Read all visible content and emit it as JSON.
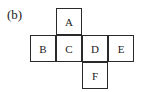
{
  "figure_label": "(b)",
  "net": {
    "description": "Cube net",
    "cells": [
      {
        "label": "A",
        "col": 1,
        "row": 0
      },
      {
        "label": "B",
        "col": 0,
        "row": 1
      },
      {
        "label": "C",
        "col": 1,
        "row": 1
      },
      {
        "label": "D",
        "col": 2,
        "row": 1
      },
      {
        "label": "E",
        "col": 3,
        "row": 1
      },
      {
        "label": "F",
        "col": 2,
        "row": 2
      }
    ]
  }
}
